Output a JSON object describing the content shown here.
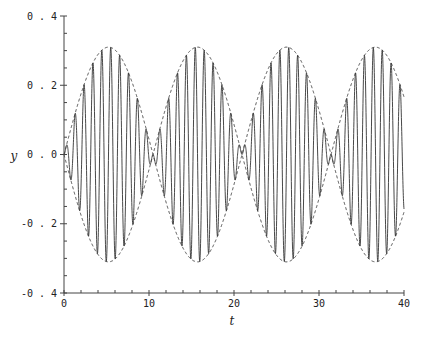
{
  "chart_data": {
    "type": "line",
    "title": "",
    "xlabel": "t",
    "ylabel": "y",
    "xlim": [
      0,
      40
    ],
    "ylim": [
      -0.4,
      0.4
    ],
    "grid": false,
    "legend": null,
    "x_ticks": [
      "0",
      "10",
      "20",
      "30",
      "40"
    ],
    "y_ticks": [
      "-0.4",
      "-0.2",
      "0.0",
      "0.2",
      "0.4"
    ],
    "x_minor_tick_step": 2,
    "y_minor_tick_step": 0.05,
    "series": [
      {
        "name": "signal",
        "style": "solid",
        "formula": "y = 0.31*sin(0.3*t)*sin(6*t)",
        "amplitude": 0.31,
        "envelope_freq": 0.3,
        "carrier_freq": 6.0
      },
      {
        "name": "upper envelope",
        "style": "dashed",
        "formula": "y = 0.31*|sin(0.3*t)|"
      },
      {
        "name": "lower envelope",
        "style": "dashed",
        "formula": "y = -0.31*|sin(0.3*t)|"
      }
    ],
    "annotations": {
      "envelope_peaks_t": [
        5.2,
        15.7,
        26.2,
        36.7
      ],
      "envelope_peak_value": 0.31,
      "envelope_zeros_t": [
        0,
        10.5,
        21,
        31.4
      ]
    }
  }
}
